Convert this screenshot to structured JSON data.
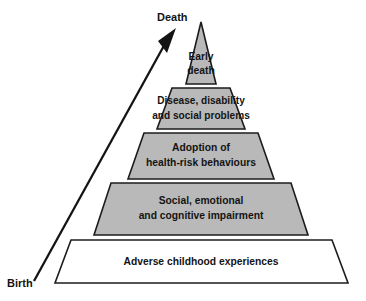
{
  "diagram": {
    "type": "pyramid",
    "orientation": "apex-up",
    "tier_count": 5,
    "colors": {
      "tier_fill": "#b9b9b9",
      "base_fill": "#ffffff",
      "outline": "#1c1c1c",
      "text": "#141414",
      "background": "#ffffff"
    },
    "tiers": [
      {
        "level": 1,
        "position": "apex",
        "fill": "#b9b9b9",
        "lines": [
          "Early",
          "death"
        ],
        "text": "Early death"
      },
      {
        "level": 2,
        "position": "upper-middle",
        "fill": "#b9b9b9",
        "lines": [
          "Disease, disability",
          "and social problems"
        ],
        "text": "Disease, disability and social problems"
      },
      {
        "level": 3,
        "position": "middle",
        "fill": "#b9b9b9",
        "lines": [
          "Adoption of",
          "health-risk behaviours"
        ],
        "text": "Adoption of health-risk behaviours"
      },
      {
        "level": 4,
        "position": "lower-middle",
        "fill": "#b9b9b9",
        "lines": [
          "Social, emotional",
          "and cognitive impairment"
        ],
        "text": "Social, emotional and cognitive impairment"
      },
      {
        "level": 5,
        "position": "base",
        "fill": "#ffffff",
        "lines": [
          "Adverse childhood experiences"
        ],
        "text": "Adverse childhood experiences"
      }
    ],
    "axis_arrow": {
      "name": "lifecourse-arrow",
      "direction": "upward",
      "start_label": "Birth",
      "end_label": "Death"
    },
    "labels": {
      "top": "Death",
      "bottom": "Birth"
    }
  }
}
